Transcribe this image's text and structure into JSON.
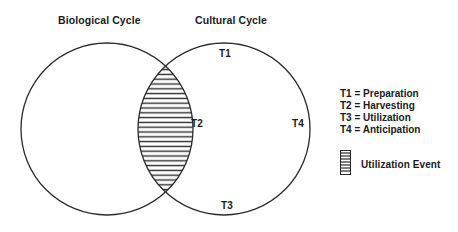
{
  "titles": {
    "left": "Biological Cycle",
    "right": "Cultural Cycle"
  },
  "points": {
    "t1": "T1",
    "t2": "T2",
    "t3": "T3",
    "t4": "T4"
  },
  "legend": {
    "items": [
      "T1 = Preparation",
      "T2 = Harvesting",
      "T3 = Utilization",
      "T4 = Anticipation"
    ],
    "hatch_label": "Utilization Event"
  },
  "colors": {
    "stroke": "#2a2a2a",
    "background": "#ffffff"
  }
}
